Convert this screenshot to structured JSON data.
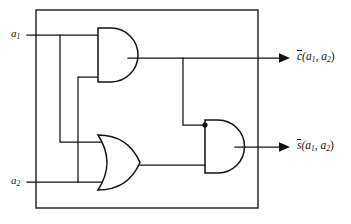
{
  "diagram": {
    "type": "logic-circuit",
    "stroke_color": "#121212",
    "background_color": "#ffffff",
    "frame": {
      "x": 36,
      "y": 10,
      "width": 222,
      "height": 198
    }
  },
  "inputs": [
    {
      "id": "a1",
      "name": "a",
      "subscript": "1",
      "label": "a",
      "y": 35,
      "label_x": 11,
      "label_y": 29
    },
    {
      "id": "a2",
      "name": "a",
      "subscript": "2",
      "label": "a",
      "y": 182,
      "label_x": 11,
      "label_y": 176
    }
  ],
  "outputs": [
    {
      "id": "c_bar",
      "symbol": "c",
      "overbar": true,
      "args": "(a",
      "arg1_sub": "1",
      "comma": ", a",
      "arg2_sub": "2",
      "close": ")",
      "y": 58,
      "label_x": 297,
      "label_y": 51,
      "arrow_tip_x": 290
    },
    {
      "id": "s_bar",
      "symbol": "s",
      "overbar": true,
      "args": "(a",
      "arg1_sub": "1",
      "comma": ", a",
      "arg2_sub": "2",
      "close": ")",
      "y": 147,
      "label_x": 297,
      "label_y": 140,
      "arrow_tip_x": 290
    }
  ],
  "gates": [
    {
      "id": "and-1",
      "kind": "AND",
      "label": "AND",
      "x": 98,
      "y": 28,
      "width": 30,
      "height": 54,
      "output_y": 58
    },
    {
      "id": "or-1",
      "kind": "OR",
      "label": "OR",
      "x": 98,
      "y": 135,
      "width": 42,
      "height": 55,
      "output_y": 165
    },
    {
      "id": "and-2",
      "kind": "AND",
      "label": "AND",
      "x": 205,
      "y": 120,
      "width": 30,
      "height": 53,
      "output_y": 147
    }
  ],
  "junctions": [
    {
      "id": "dot-and2-input",
      "x": 205,
      "y": 125,
      "r": 2.6
    }
  ],
  "nets": [
    {
      "id": "a1-main",
      "from": "a1",
      "to": "and-1.in-top"
    },
    {
      "id": "a1-branch-down",
      "from": "a1",
      "to": "or-1.in-top"
    },
    {
      "id": "a2-branch-up",
      "from": "a2",
      "to": "and-1.in-bottom"
    },
    {
      "id": "a2-main",
      "from": "a2",
      "to": "or-1.in-bottom"
    },
    {
      "id": "c-bar-net",
      "from": "and-1.out",
      "to": "c_bar"
    },
    {
      "id": "c-bar-tap",
      "from": "and-1.out",
      "to": "and-2.in-top"
    },
    {
      "id": "or-out-net",
      "from": "or-1.out",
      "to": "and-2.in-bottom"
    },
    {
      "id": "s-bar-net",
      "from": "and-2.out",
      "to": "s_bar"
    }
  ]
}
